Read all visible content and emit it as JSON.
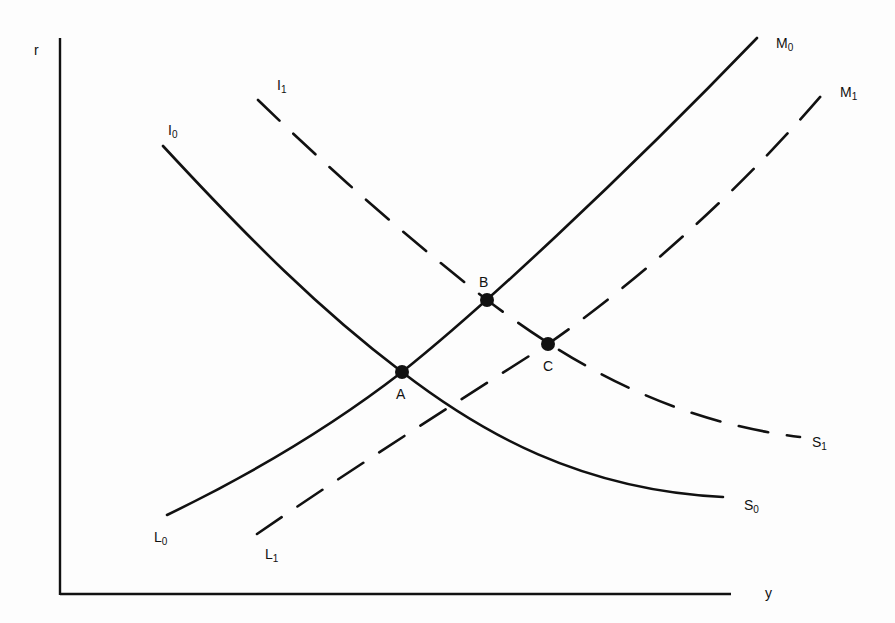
{
  "diagram": {
    "type": "IS-LM diagram",
    "axes": {
      "x_label": "y",
      "y_label": "r"
    },
    "curves": [
      {
        "id": "I0S0",
        "label_start": "I",
        "label_start_sub": "0",
        "label_end": "S",
        "label_end_sub": "0",
        "style": "solid"
      },
      {
        "id": "I1S1",
        "label_start": "I",
        "label_start_sub": "1",
        "label_end": "S",
        "label_end_sub": "1",
        "style": "dashed"
      },
      {
        "id": "L0M0",
        "label_start": "L",
        "label_start_sub": "0",
        "label_end": "M",
        "label_end_sub": "0",
        "style": "solid"
      },
      {
        "id": "L1M1",
        "label_start": "L",
        "label_start_sub": "1",
        "label_end": "M",
        "label_end_sub": "1",
        "style": "dashed"
      }
    ],
    "points": [
      {
        "label": "A",
        "desc": "intersection of I0S0 and L0M0"
      },
      {
        "label": "B",
        "desc": "intersection of I1S1 and L0M0"
      },
      {
        "label": "C",
        "desc": "intersection of I1S1 and L1M1"
      }
    ]
  }
}
